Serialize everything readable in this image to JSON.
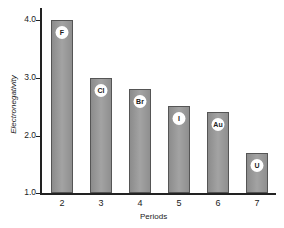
{
  "chart_data": {
    "type": "bar",
    "title": "",
    "xlabel": "Periods",
    "ylabel": "Electronegativity",
    "categories": [
      "2",
      "3",
      "4",
      "5",
      "6",
      "7"
    ],
    "values": [
      4.0,
      3.0,
      2.8,
      2.5,
      2.4,
      1.7
    ],
    "bar_labels": [
      "F",
      "Cl",
      "Br",
      "I",
      "Au",
      "U"
    ],
    "ylim": [
      1.0,
      4.2
    ],
    "yticks": [
      "1.0",
      "2.0",
      "3.0",
      "4.0"
    ],
    "grid": false,
    "legend": null
  }
}
